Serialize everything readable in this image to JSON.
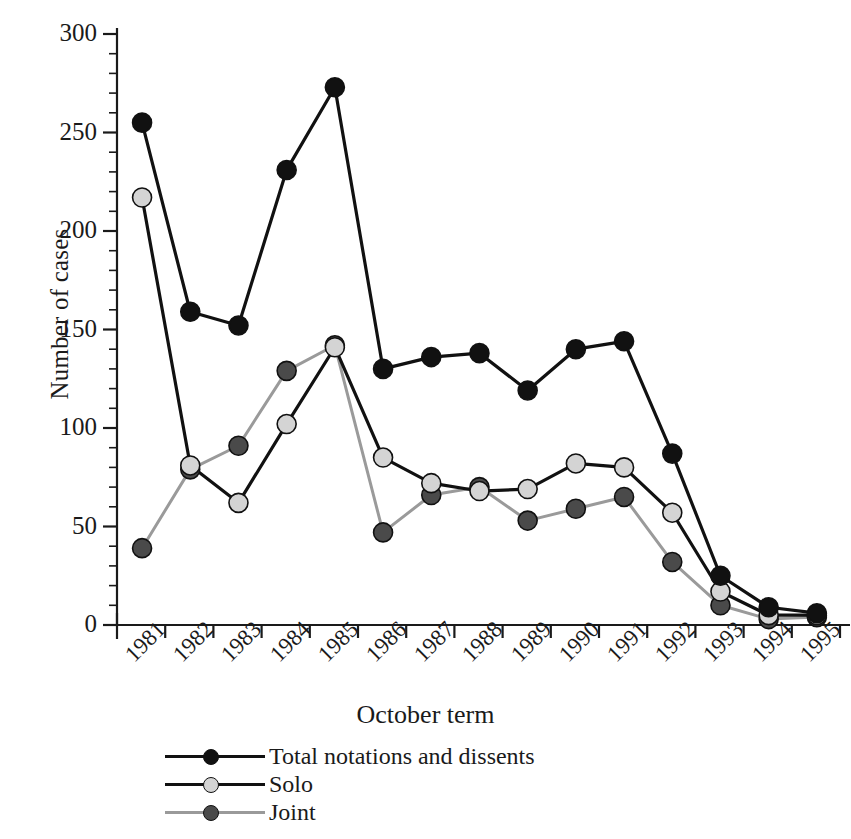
{
  "chart_data": {
    "type": "line",
    "title": "",
    "xlabel": "October term",
    "ylabel": "Number of cases",
    "categories": [
      "1981",
      "1982",
      "1983",
      "1984",
      "1985",
      "1986",
      "1987",
      "1988",
      "1989",
      "1990",
      "1991",
      "1992",
      "1993",
      "1994",
      "1995"
    ],
    "ylim": [
      0,
      300
    ],
    "yticks": [
      0,
      50,
      100,
      150,
      200,
      250,
      300
    ],
    "ytick_labels": [
      "0",
      "50",
      "100",
      "150",
      "200",
      "250",
      "300"
    ],
    "minor_tick_step": 10,
    "grid": false,
    "legend_position": "below-axis-left",
    "series": [
      {
        "name": "Total notations and dissents",
        "marker": "filled-circle",
        "color": "#111111",
        "line_color": "#111111",
        "values": [
          255,
          159,
          152,
          231,
          273,
          130,
          136,
          138,
          119,
          140,
          144,
          87,
          25,
          9,
          6
        ]
      },
      {
        "name": "Solo",
        "marker": "filled-circle",
        "color": "#d4d4d4",
        "line_color": "#111111",
        "values": [
          217,
          81,
          62,
          102,
          141,
          85,
          72,
          68,
          69,
          82,
          80,
          57,
          17,
          5,
          5
        ]
      },
      {
        "name": "Joint",
        "marker": "filled-circle",
        "color": "#4a4a4a",
        "line_color": "#9a9a9a",
        "values": [
          39,
          79,
          91,
          129,
          142,
          47,
          66,
          70,
          53,
          59,
          65,
          32,
          10,
          3,
          4
        ]
      }
    ]
  },
  "axes": {
    "y_axis_label": "Number of cases",
    "x_axis_label": "October term"
  },
  "legend": {
    "items": [
      {
        "label": "Total notations and dissents",
        "swatch": "black-circle"
      },
      {
        "label": "Solo",
        "swatch": "light-gray-circle"
      },
      {
        "label": "Joint",
        "swatch": "dark-gray-circle"
      }
    ]
  }
}
